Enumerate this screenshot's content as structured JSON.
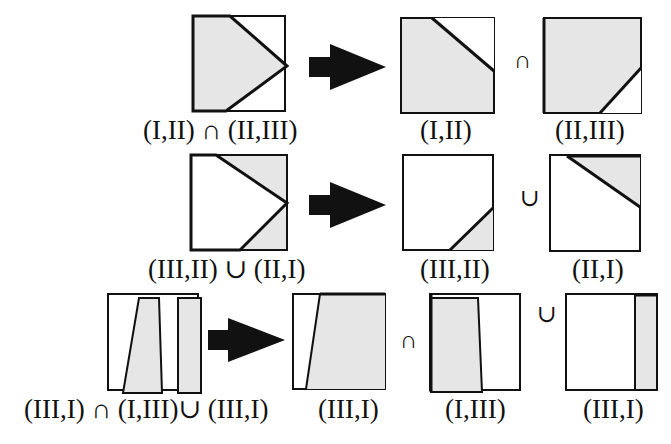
{
  "colors": {
    "fill": "#e6e6e6",
    "stroke": "#111111",
    "arrow": "#111111",
    "background": "#ffffff"
  },
  "rows": [
    {
      "source_label": "(I,II) ∩ (II,III)",
      "operator": "∩",
      "result_labels": [
        "(I,II)",
        "(II,III)"
      ]
    },
    {
      "source_label": "(III,II) ∪ (II,I)",
      "operator": "∪",
      "result_labels": [
        "(III,II)",
        "(II,I)"
      ]
    },
    {
      "source_label": "(III,I) ∩ (I,III)∪ (III,I)",
      "operators": [
        "∩",
        "∪"
      ],
      "result_labels": [
        "(III,I)",
        "(I,III)",
        "(III,I)"
      ]
    }
  ],
  "icons": {
    "arrow": "right-arrow-icon"
  }
}
